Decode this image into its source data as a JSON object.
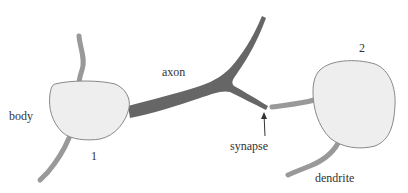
{
  "diagram": {
    "type": "neuron-synapse-illustration",
    "labels": {
      "body": "body",
      "axon": "axon",
      "synapse": "synapse",
      "dendrite": "dendrite",
      "neuron1": "1",
      "neuron2": "2"
    },
    "colors": {
      "cell_fill": "#eeeeee",
      "cell_stroke": "#888888",
      "axon": "#666666",
      "dendrite": "#999999",
      "text": "#333333",
      "arrow": "#333333"
    }
  }
}
